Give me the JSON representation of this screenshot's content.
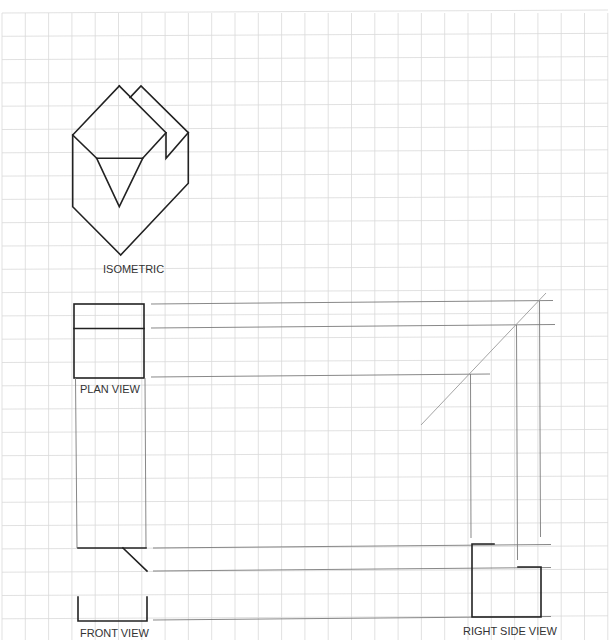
{
  "labels": {
    "isometric": "ISOMETRIC",
    "plan_view": "PLAN VIEW",
    "front_view": "FRONT VIEW",
    "right_side_view": "RIGHT SIDE VIEW"
  },
  "grid": {
    "origin_x": 2,
    "origin_y": 13,
    "spacing": 23.3,
    "max_x": 608,
    "max_y": 640,
    "color": "#d9d9d9"
  },
  "colors": {
    "object_line": "#222222",
    "projection_line": "#7a7a7a",
    "miter_line": "#9a9a9a",
    "paper": "#ffffff"
  }
}
